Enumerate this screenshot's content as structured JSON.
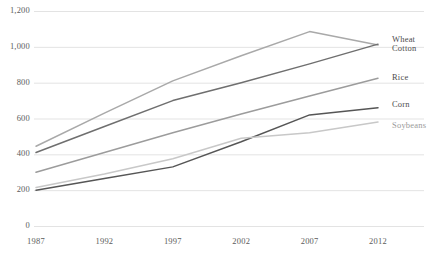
{
  "chart_data": {
    "type": "line",
    "title": "",
    "xlabel": "",
    "ylabel": "",
    "x": [
      1987,
      1992,
      1997,
      2002,
      2007,
      2012
    ],
    "categories": [
      "1987",
      "1992",
      "1997",
      "2002",
      "2007",
      "2012"
    ],
    "xlim": [
      1987,
      2012
    ],
    "ylim": [
      0,
      1200
    ],
    "yticks": [
      0,
      200,
      400,
      600,
      800,
      1000,
      1200
    ],
    "ytick_labels": [
      "0",
      "200",
      "400",
      "600",
      "800",
      "1,000",
      "1,200"
    ],
    "grid": true,
    "legend_position": "right-inline",
    "series": [
      {
        "name": "Wheat",
        "color": "#a9a9a9",
        "values": [
          445,
          630,
          810,
          950,
          1085,
          1010
        ],
        "label": "Wheat"
      },
      {
        "name": "Cotton",
        "color": "#6f6f6f",
        "values": [
          410,
          555,
          700,
          800,
          905,
          1015
        ],
        "label": "Cotton"
      },
      {
        "name": "Rice",
        "color": "#9c9c9c",
        "values": [
          300,
          410,
          520,
          625,
          725,
          825
        ],
        "label": "Rice"
      },
      {
        "name": "Corn",
        "color": "#565656",
        "values": [
          200,
          265,
          330,
          470,
          620,
          660
        ],
        "label": "Corn"
      },
      {
        "name": "Soybeans",
        "color": "#c8c8c8",
        "values": [
          215,
          290,
          375,
          490,
          520,
          580
        ],
        "label": "Soybeans"
      }
    ]
  },
  "axis": {
    "y_labels": [
      "1,200",
      "1,000",
      "800",
      "600",
      "400",
      "200",
      "0"
    ],
    "x_labels": [
      "1987",
      "1992",
      "1997",
      "2002",
      "2007",
      "2012"
    ]
  },
  "colors": {
    "gridline": "#e3e3e3",
    "axis_text": "#5c5c5c",
    "label_text": "#4d4d4d",
    "background": "#ffffff"
  }
}
